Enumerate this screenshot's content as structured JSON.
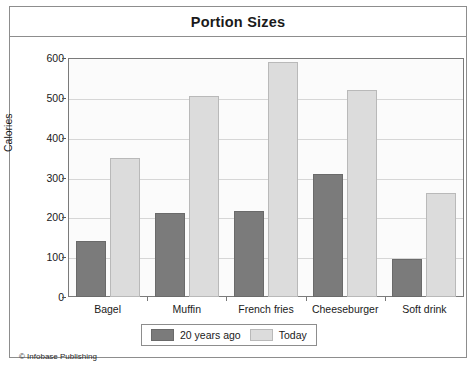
{
  "figure": {
    "title": "Portion Sizes",
    "credit": "© Infobase Publishing"
  },
  "chart_data": {
    "type": "bar",
    "title": "Portion Sizes",
    "xlabel": "",
    "ylabel": "Calories",
    "ylim": [
      0,
      600
    ],
    "yticks": [
      0,
      100,
      200,
      300,
      400,
      500,
      600
    ],
    "ytick_labels": [
      "0",
      "100",
      "200",
      "300",
      "400",
      "500",
      "600"
    ],
    "grid": true,
    "legend_position": "bottom-center",
    "categories": [
      "Bagel",
      "Muffin",
      "French fries",
      "Cheeseburger",
      "Soft drink"
    ],
    "series": [
      {
        "name": "20 years ago",
        "color": "#7b7b7b",
        "values": [
          140,
          210,
          215,
          310,
          95
        ]
      },
      {
        "name": "Today",
        "color": "#dcdcdc",
        "values": [
          350,
          505,
          590,
          520,
          260
        ]
      }
    ]
  },
  "legend": {
    "items": [
      {
        "label": "20 years ago",
        "swatch": "old"
      },
      {
        "label": "Today",
        "swatch": "today"
      }
    ]
  }
}
